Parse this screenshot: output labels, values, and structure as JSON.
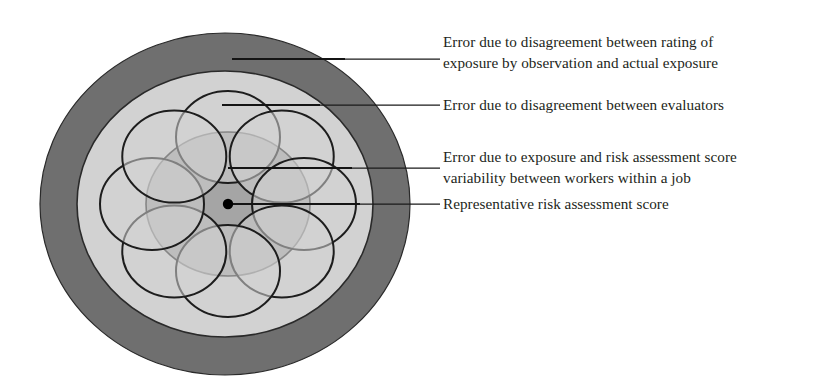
{
  "figure": {
    "type": "concentric-target-diagram",
    "background_color": "#ffffff"
  },
  "zones": [
    {
      "id": "outer-ring",
      "name": "observation-vs-actual-exposure-zone",
      "color": "#6f6f6f",
      "cx": 225,
      "cy": 204,
      "rx": 185,
      "ry": 171
    },
    {
      "id": "middle-ring",
      "name": "evaluator-disagreement-zone",
      "color": "#d2d2d2",
      "cx": 225,
      "cy": 204,
      "rx": 148,
      "ry": 133
    },
    {
      "id": "inner-disk",
      "name": "worker-variability-zone",
      "color": "#a5a5a5",
      "cx": 228,
      "cy": 204,
      "rx": 82,
      "ry": 72
    }
  ],
  "worker_circles": {
    "count": 8,
    "fill": "#d2d2d2",
    "fill_opacity": 0.55,
    "stroke": "#1d1d1d",
    "rx": 52,
    "ry": 46,
    "orbit_rx": 76,
    "orbit_ry": 67,
    "center": {
      "cx": 228,
      "cy": 204
    },
    "start_angle_deg": -90
  },
  "center_point": {
    "name": "representative-risk-assessment-score-point",
    "cx": 228,
    "cy": 204,
    "r": 5.2,
    "color": "#000000"
  },
  "callouts": [
    {
      "id": "callout-1",
      "name": "callout-observation-vs-actual-exposure",
      "anchor_x": 232,
      "anchor_y": 59,
      "elbow_x": 345,
      "line_end_x": 440,
      "text_x": 443,
      "thick_until_x": 345,
      "lines": [
        "Error due to disagreement between rating of",
        "exposure by observation and actual exposure"
      ],
      "text_y_first": 47,
      "line_height": 20.5
    },
    {
      "id": "callout-2",
      "name": "callout-evaluator-disagreement",
      "anchor_x": 222,
      "anchor_y": 105,
      "elbow_x": 320,
      "line_end_x": 440,
      "text_x": 443,
      "thick_until_x": 320,
      "lines": [
        "Error due to disagreement between evaluators"
      ],
      "text_y_first": 110,
      "line_height": 20.5
    },
    {
      "id": "callout-3",
      "name": "callout-worker-variability",
      "anchor_x": 228,
      "anchor_y": 168,
      "elbow_x": 352,
      "line_end_x": 440,
      "text_x": 443,
      "thick_until_x": 352,
      "lines": [
        "Error due to exposure and risk assessment score",
        "variability between workers within a job"
      ],
      "text_y_first": 162,
      "line_height": 20.5
    },
    {
      "id": "callout-4",
      "name": "callout-representative-score",
      "anchor_x": 233,
      "anchor_y": 204,
      "elbow_x": 360,
      "line_end_x": 440,
      "text_x": 443,
      "thick_until_x": 360,
      "lines": [
        "Representative risk assessment score"
      ],
      "text_y_first": 209,
      "line_height": 20.5
    }
  ]
}
